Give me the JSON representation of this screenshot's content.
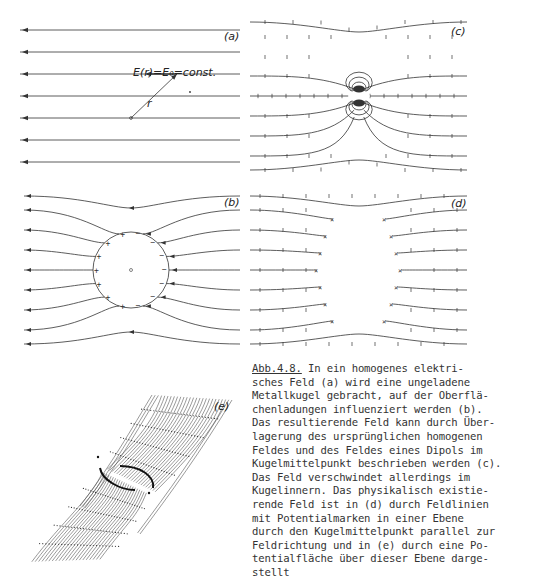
{
  "figure": {
    "id": "Abb.4.8.",
    "panels": {
      "a": {
        "label": "(a)",
        "annotation": "E(r)=E₀=const.",
        "vector_label": "r",
        "x_start": 20,
        "x_end": 240,
        "lines_y": [
          30,
          52,
          74,
          96,
          118,
          140,
          162
        ],
        "origin": [
          131,
          118
        ],
        "vector_tip": [
          177,
          74
        ],
        "dot": [
          190,
          92
        ]
      },
      "b": {
        "label": "(b)",
        "sphere_center": [
          131,
          270
        ],
        "sphere_radius": 38,
        "lines_y": [
          196,
          210,
          230,
          250,
          270,
          290,
          310,
          330,
          344
        ],
        "left_charge": "+",
        "right_charge": "−"
      },
      "c": {
        "label": "(c)",
        "dipole_center": [
          359,
          96
        ],
        "lines_y": [
          22,
          37,
          57,
          76,
          96,
          116,
          136,
          156,
          170
        ]
      },
      "d": {
        "label": "(d)",
        "center": [
          359,
          270
        ],
        "lines_y": [
          196,
          210,
          230,
          250,
          270,
          290,
          310,
          330,
          344
        ]
      },
      "e": {
        "label": "(e)",
        "description": "Potential surface in perspective"
      }
    },
    "caption_lines": [
      "In ein homogenes elektri-",
      "sches Feld (a) wird eine ungeladene",
      "Metallkugel gebracht, auf der Oberflä-",
      "chenladungen influenziert werden (b).",
      "Das resultierende Feld kann durch Über-",
      "lagerung des ursprünglichen homogenen",
      "Feldes und des Feldes eines Dipols im",
      "Kugelmittelpunkt beschrieben werden (c).",
      "Das Feld verschwindet allerdings im",
      "Kugelinnern. Das physikalisch existie-",
      "rende Feld ist in (d) durch Feldlinien",
      "mit Potentialmarken in einer Ebene",
      "durch den Kugelmittelpunkt parallel zur",
      "Feldrichtung und in (e) durch eine Po-",
      "tentialfläche über dieser Ebene darge-",
      "stellt"
    ]
  },
  "colors": {
    "ink": "#333333",
    "light_ink": "#777777",
    "background": "#ffffff"
  }
}
